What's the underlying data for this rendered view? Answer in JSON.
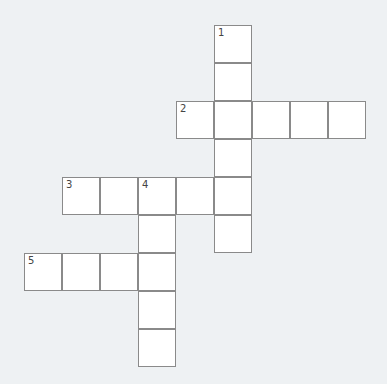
{
  "puzzle": {
    "type": "crossword",
    "cell_size": 38,
    "origin": {
      "x": 24,
      "y": 25
    },
    "words": [
      {
        "number": "1",
        "direction": "down",
        "row": 0,
        "col": 5,
        "length": 6
      },
      {
        "number": "2",
        "direction": "across",
        "row": 2,
        "col": 4,
        "length": 5
      },
      {
        "number": "3",
        "direction": "across",
        "row": 4,
        "col": 1,
        "length": 5
      },
      {
        "number": "4",
        "direction": "down",
        "row": 4,
        "col": 3,
        "length": 5
      },
      {
        "number": "5",
        "direction": "across",
        "row": 6,
        "col": 0,
        "length": 4
      }
    ]
  },
  "colors": {
    "background": "#eef1f3",
    "cell": "#ffffff",
    "border": "#8a8a8a"
  }
}
